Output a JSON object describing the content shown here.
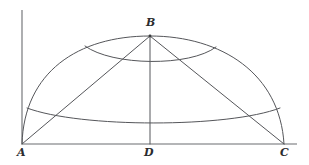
{
  "figure": {
    "type": "geometry-diagram",
    "width": 309,
    "height": 165,
    "background_color": "#ffffff",
    "line_color": "#55565a",
    "label_color": "#2b2c2e",
    "labels": [
      {
        "id": "A",
        "text": "A",
        "x": 17,
        "y": 147
      },
      {
        "id": "B",
        "text": "B",
        "x": 146,
        "y": 17
      },
      {
        "id": "D",
        "text": "D",
        "x": 144,
        "y": 147
      },
      {
        "id": "C",
        "text": "C",
        "x": 280,
        "y": 147
      }
    ],
    "points": {
      "A": {
        "x": 22,
        "y": 144
      },
      "B": {
        "x": 150,
        "y": 36
      },
      "D": {
        "x": 150,
        "y": 144
      },
      "C": {
        "x": 284,
        "y": 144
      }
    },
    "elements": {
      "vertical_axis": "vertical line rising from A",
      "baseline": "horizontal segment A to C",
      "outer_arc": "large arc from A through B to C",
      "chord_ab": "segment A to B",
      "chord_bc": "segment B to C",
      "altitude_bd": "vertical segment B to D",
      "upper_arc": "small arc crossing below B",
      "lower_arc": "wide arc sagging between the sides"
    }
  }
}
